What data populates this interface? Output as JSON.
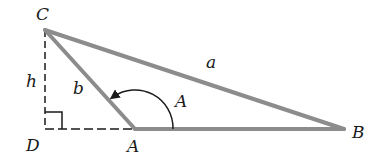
{
  "diagram": {
    "type": "triangle-obtuse-altitude",
    "vertices": {
      "C": {
        "label": "C",
        "x": 45,
        "y": 30
      },
      "D": {
        "label": "D",
        "x": 45,
        "y": 129
      },
      "A": {
        "label": "A",
        "x": 135,
        "y": 129
      },
      "B": {
        "label": "B",
        "x": 344,
        "y": 129
      }
    },
    "labels": {
      "C": "C",
      "D": "D",
      "A_vertex": "A",
      "B": "B",
      "a": "a",
      "b": "b",
      "h": "h",
      "A_angle": "A"
    },
    "colors": {
      "triangle_stroke": "#8c8c8c",
      "dashed_stroke": "#1a1a1a",
      "arc_stroke": "#1a1a1a",
      "text": "#1a1a1a"
    }
  }
}
